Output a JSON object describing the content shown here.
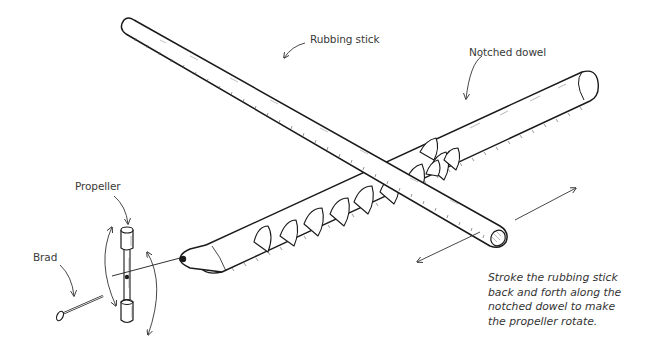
{
  "diagram": {
    "labels": {
      "rubbing_stick": "Rubbing stick",
      "notched_dowel": "Notched dowel",
      "propeller": "Propeller",
      "brad": "Brad"
    },
    "caption": {
      "lines": [
        "Stroke the rubbing stick",
        "back and forth along the",
        "notched dowel to make",
        "the propeller rotate."
      ]
    },
    "colors": {
      "ink": "#1a1a1a",
      "label_text": "#3a3a3a",
      "background": "#ffffff"
    }
  }
}
